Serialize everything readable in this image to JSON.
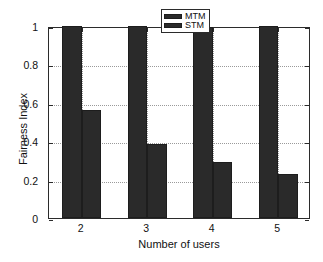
{
  "chart_data": {
    "type": "bar",
    "title": "",
    "xlabel": "Number of users",
    "ylabel": "Fairness Index",
    "categories": [
      "2",
      "3",
      "4",
      "5"
    ],
    "series": [
      {
        "name": "MTM",
        "values": [
          1.0,
          1.0,
          0.995,
          0.998
        ],
        "color": "#2a2a2a"
      },
      {
        "name": "STM",
        "values": [
          0.565,
          0.385,
          0.29,
          0.23
        ],
        "color": "#2a2a2a"
      }
    ],
    "ylim": [
      0,
      1
    ],
    "yticks": [
      0,
      0.2,
      0.4,
      0.6,
      0.8,
      1
    ],
    "ytick_labels": [
      "0",
      "0.2",
      "0.4",
      "0.6",
      "0.8",
      "1"
    ],
    "xtick_labels": [
      "2",
      "3",
      "4",
      "5"
    ],
    "grid": true,
    "grid_style": "dotted",
    "legend_position": "top-center",
    "legend_entries": [
      "MTM",
      "STM"
    ],
    "background": "#ffffff",
    "axis_color": "#2b2b2b"
  }
}
